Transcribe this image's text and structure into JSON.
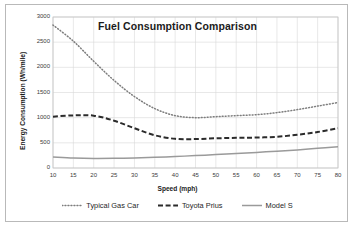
{
  "chart_data": {
    "type": "line",
    "title": "Fuel Consumption Comparison",
    "xlabel": "Speed (mph)",
    "ylabel": "Energy Consumption (Wh/mile)",
    "xlim": [
      10,
      80
    ],
    "ylim": [
      0,
      3000
    ],
    "xticks": [
      10,
      15,
      20,
      25,
      30,
      35,
      40,
      45,
      50,
      55,
      60,
      65,
      70,
      75,
      80
    ],
    "yticks": [
      0,
      500,
      1000,
      1500,
      2000,
      2500,
      3000
    ],
    "grid": true,
    "legend_position": "bottom",
    "x": [
      10,
      15,
      20,
      25,
      30,
      35,
      40,
      45,
      50,
      55,
      60,
      65,
      70,
      75,
      80
    ],
    "series": [
      {
        "name": "Typical Gas Car",
        "style": "dotted",
        "color": "#7d7d7d",
        "values": [
          2840,
          2520,
          2120,
          1740,
          1420,
          1180,
          1040,
          1000,
          1020,
          1040,
          1060,
          1100,
          1160,
          1230,
          1300
        ]
      },
      {
        "name": "Toyota Prius",
        "style": "dashed",
        "color": "#2b2b2b",
        "values": [
          1020,
          1045,
          1040,
          940,
          790,
          650,
          580,
          575,
          590,
          600,
          605,
          620,
          660,
          715,
          790
        ]
      },
      {
        "name": "Model S",
        "style": "solid",
        "color": "#9a9a9a",
        "values": [
          220,
          200,
          190,
          192,
          200,
          212,
          228,
          246,
          266,
          288,
          310,
          335,
          360,
          390,
          420
        ]
      }
    ]
  },
  "axes": {
    "x_tick_labels": [
      "10",
      "15",
      "20",
      "25",
      "30",
      "35",
      "40",
      "45",
      "50",
      "55",
      "60",
      "65",
      "70",
      "75",
      "80"
    ],
    "y_tick_labels": [
      "0",
      "500",
      "1000",
      "1500",
      "2000",
      "2500",
      "3000"
    ]
  },
  "colors": {
    "frame_border": "#b9b9b9",
    "plot_border": "#c4c4c4",
    "grid": "#d8d8d8",
    "background": "#ffffff",
    "text": "#262626"
  }
}
